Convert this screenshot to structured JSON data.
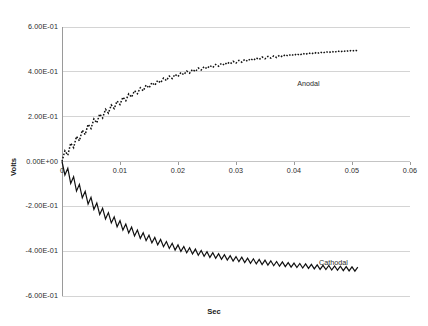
{
  "chart_data": {
    "type": "line",
    "title": "",
    "xlabel": "Sec",
    "ylabel": "Volts",
    "xlim": [
      0,
      0.06
    ],
    "ylim": [
      -0.6,
      0.6
    ],
    "grid": true,
    "legend_position": "inline-annotation",
    "x_ticks": [
      "0",
      "0.01",
      "0.02",
      "0.03",
      "0.04",
      "0.05",
      "0.06"
    ],
    "x_tick_values": [
      0,
      0.01,
      0.02,
      0.03,
      0.04,
      0.05,
      0.06
    ],
    "y_ticks": [
      "6.00E-01",
      "4.00E-01",
      "2.00E-01",
      "0.00E+00",
      "-2.00E-01",
      "-4.00E-01",
      "-6.00E-01"
    ],
    "y_tick_values": [
      0.6,
      0.4,
      0.2,
      0,
      -0.2,
      -0.4,
      -0.6
    ],
    "series": [
      {
        "name": "Anodal",
        "style": "dotted",
        "color": "#111111",
        "x": [
          0.0,
          0.0005,
          0.001,
          0.0015,
          0.002,
          0.0025,
          0.003,
          0.0035,
          0.004,
          0.0045,
          0.005,
          0.0055,
          0.006,
          0.0065,
          0.007,
          0.0075,
          0.008,
          0.0085,
          0.009,
          0.0095,
          0.01,
          0.0105,
          0.011,
          0.0115,
          0.012,
          0.0125,
          0.013,
          0.0135,
          0.014,
          0.0145,
          0.015,
          0.0155,
          0.016,
          0.0165,
          0.017,
          0.0175,
          0.018,
          0.0185,
          0.019,
          0.0195,
          0.02,
          0.0205,
          0.021,
          0.0215,
          0.022,
          0.0225,
          0.023,
          0.0235,
          0.024,
          0.0245,
          0.025,
          0.0255,
          0.026,
          0.0265,
          0.027,
          0.0275,
          0.028,
          0.0285,
          0.029,
          0.0295,
          0.03,
          0.0305,
          0.031,
          0.0315,
          0.032,
          0.0325,
          0.033,
          0.0335,
          0.034,
          0.0345,
          0.035,
          0.0355,
          0.036,
          0.0365,
          0.037,
          0.0375,
          0.038,
          0.0385,
          0.039,
          0.0395,
          0.04,
          0.0405,
          0.041,
          0.0415,
          0.042,
          0.0425,
          0.043,
          0.0435,
          0.044,
          0.0445,
          0.045,
          0.0455,
          0.046,
          0.0465,
          0.047,
          0.0475,
          0.048,
          0.0485,
          0.049,
          0.0495,
          0.05,
          0.0505,
          0.051
        ],
        "y": [
          0.0,
          0.048,
          0.028,
          0.082,
          0.062,
          0.112,
          0.092,
          0.14,
          0.12,
          0.166,
          0.147,
          0.19,
          0.172,
          0.212,
          0.194,
          0.233,
          0.216,
          0.252,
          0.236,
          0.27,
          0.254,
          0.287,
          0.271,
          0.302,
          0.287,
          0.316,
          0.302,
          0.329,
          0.315,
          0.341,
          0.328,
          0.352,
          0.34,
          0.362,
          0.351,
          0.372,
          0.361,
          0.381,
          0.37,
          0.389,
          0.379,
          0.397,
          0.387,
          0.404,
          0.394,
          0.411,
          0.401,
          0.417,
          0.408,
          0.423,
          0.414,
          0.428,
          0.419,
          0.433,
          0.425,
          0.438,
          0.43,
          0.443,
          0.435,
          0.447,
          0.439,
          0.451,
          0.443,
          0.455,
          0.447,
          0.459,
          0.451,
          0.462,
          0.455,
          0.466,
          0.458,
          0.469,
          0.461,
          0.471,
          0.464,
          0.474,
          0.467,
          0.477,
          0.47,
          0.479,
          0.472,
          0.481,
          0.474,
          0.483,
          0.477,
          0.485,
          0.479,
          0.487,
          0.481,
          0.489,
          0.483,
          0.491,
          0.485,
          0.492,
          0.486,
          0.494,
          0.488,
          0.495,
          0.489,
          0.497,
          0.491,
          0.498,
          0.492
        ]
      },
      {
        "name": "Cathodal",
        "style": "solid",
        "color": "#111111",
        "x": [
          0.0,
          0.0005,
          0.001,
          0.0015,
          0.002,
          0.0025,
          0.003,
          0.0035,
          0.004,
          0.0045,
          0.005,
          0.0055,
          0.006,
          0.0065,
          0.007,
          0.0075,
          0.008,
          0.0085,
          0.009,
          0.0095,
          0.01,
          0.0105,
          0.011,
          0.0115,
          0.012,
          0.0125,
          0.013,
          0.0135,
          0.014,
          0.0145,
          0.015,
          0.0155,
          0.016,
          0.0165,
          0.017,
          0.0175,
          0.018,
          0.0185,
          0.019,
          0.0195,
          0.02,
          0.0205,
          0.021,
          0.0215,
          0.022,
          0.0225,
          0.023,
          0.0235,
          0.024,
          0.0245,
          0.025,
          0.0255,
          0.026,
          0.0265,
          0.027,
          0.0275,
          0.028,
          0.0285,
          0.029,
          0.0295,
          0.03,
          0.0305,
          0.031,
          0.0315,
          0.032,
          0.0325,
          0.033,
          0.0335,
          0.034,
          0.0345,
          0.035,
          0.0355,
          0.036,
          0.0365,
          0.037,
          0.0375,
          0.038,
          0.0385,
          0.039,
          0.0395,
          0.04,
          0.0405,
          0.041,
          0.0415,
          0.042,
          0.0425,
          0.043,
          0.0435,
          0.044,
          0.0445,
          0.045,
          0.0455,
          0.046,
          0.0465,
          0.047,
          0.0475,
          0.048,
          0.0485,
          0.049,
          0.0495,
          0.05,
          0.0505,
          0.051
        ],
        "y": [
          0.0,
          -0.06,
          -0.03,
          -0.098,
          -0.068,
          -0.132,
          -0.102,
          -0.162,
          -0.133,
          -0.19,
          -0.16,
          -0.214,
          -0.185,
          -0.236,
          -0.208,
          -0.256,
          -0.228,
          -0.274,
          -0.247,
          -0.291,
          -0.264,
          -0.306,
          -0.279,
          -0.319,
          -0.293,
          -0.332,
          -0.306,
          -0.343,
          -0.318,
          -0.353,
          -0.329,
          -0.363,
          -0.339,
          -0.372,
          -0.348,
          -0.38,
          -0.357,
          -0.388,
          -0.365,
          -0.395,
          -0.372,
          -0.401,
          -0.379,
          -0.407,
          -0.385,
          -0.413,
          -0.391,
          -0.418,
          -0.397,
          -0.423,
          -0.402,
          -0.428,
          -0.407,
          -0.432,
          -0.411,
          -0.436,
          -0.416,
          -0.44,
          -0.42,
          -0.444,
          -0.424,
          -0.447,
          -0.427,
          -0.451,
          -0.431,
          -0.454,
          -0.434,
          -0.457,
          -0.437,
          -0.46,
          -0.44,
          -0.462,
          -0.443,
          -0.465,
          -0.446,
          -0.467,
          -0.448,
          -0.469,
          -0.451,
          -0.471,
          -0.453,
          -0.473,
          -0.455,
          -0.475,
          -0.457,
          -0.477,
          -0.459,
          -0.479,
          -0.461,
          -0.481,
          -0.463,
          -0.482,
          -0.464,
          -0.484,
          -0.466,
          -0.485,
          -0.467,
          -0.487,
          -0.469,
          -0.488,
          -0.47,
          -0.489,
          -0.471
        ]
      }
    ],
    "annotations": [
      {
        "text": "Anodal",
        "x": 0.0425,
        "y": 0.345
      },
      {
        "text": "Cathodal",
        "x": 0.0468,
        "y": -0.455
      }
    ],
    "colors": {
      "gridline": "#d4d4d4",
      "axis": "#9a9a9a",
      "trace": "#111111",
      "text": "#2b2b2b",
      "background": "#ffffff"
    }
  }
}
